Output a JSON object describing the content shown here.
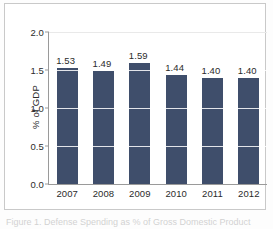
{
  "figure": {
    "caption": "Figure 1. Defense Spending as % of Gross Domestic Product",
    "ylabel": "% of GDP"
  },
  "chart_data": {
    "type": "bar",
    "title": "",
    "xlabel": "",
    "ylabel": "% of GDP",
    "categories": [
      "2007",
      "2008",
      "2009",
      "2010",
      "2011",
      "2012"
    ],
    "values": [
      1.53,
      1.49,
      1.59,
      1.44,
      1.4,
      1.4
    ],
    "value_labels": [
      "1.53",
      "1.49",
      "1.59",
      "1.44",
      "1.40",
      "1.40"
    ],
    "ylim": [
      0.0,
      2.0
    ],
    "yticks": [
      0.0,
      0.5,
      1.0,
      1.5,
      2.0
    ],
    "ytick_labels": [
      "0.0",
      "0.5",
      "1.0",
      "1.5",
      "2.0"
    ],
    "grid": true,
    "legend": false,
    "bar_color": "#3f4e6b",
    "gridline_color": "#ffffff",
    "axis_color": "#9a9a9a"
  }
}
